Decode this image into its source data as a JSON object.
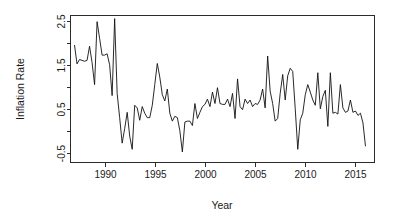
{
  "figure": {
    "background_color": "#ffffff",
    "line_color": "#111111",
    "axis_color": "#2b2b2b",
    "text_color": "#1a1a1a"
  },
  "chart_data": {
    "type": "line",
    "title": "",
    "subtitle": "",
    "xlabel": "Year",
    "ylabel": "Inflation Rate",
    "xlim": [
      1986.6,
      2016.9
    ],
    "ylim": [
      -0.72,
      2.62
    ],
    "grid": false,
    "legend": "none",
    "box": true,
    "x_ticks": [
      1990,
      1995,
      2000,
      2005,
      2010,
      2015
    ],
    "x_tick_labels": [
      "1990",
      "1995",
      "2000",
      "2005",
      "2010",
      "2015"
    ],
    "x_minor_ticks": [],
    "y_ticks": [
      -0.5,
      0.0,
      0.5,
      1.0,
      1.5,
      2.0,
      2.5
    ],
    "y_tick_labels": [
      "-0.5",
      "",
      "0.5",
      "",
      "1.5",
      "",
      "2.5"
    ],
    "series": [
      {
        "name": "Inflation Rate",
        "x": [
          1987.0,
          1987.25,
          1987.5,
          1987.75,
          1988.0,
          1988.25,
          1988.5,
          1988.75,
          1989.0,
          1989.25,
          1989.5,
          1989.75,
          1990.0,
          1990.25,
          1990.5,
          1990.75,
          1991.0,
          1991.25,
          1991.5,
          1991.75,
          1992.0,
          1992.25,
          1992.5,
          1992.75,
          1993.0,
          1993.25,
          1993.5,
          1993.75,
          1994.0,
          1994.25,
          1994.5,
          1994.75,
          1995.0,
          1995.25,
          1995.5,
          1995.75,
          1996.0,
          1996.25,
          1996.5,
          1996.75,
          1997.0,
          1997.25,
          1997.5,
          1997.75,
          1998.0,
          1998.25,
          1998.5,
          1998.75,
          1999.0,
          1999.25,
          1999.5,
          1999.75,
          2000.0,
          2000.25,
          2000.5,
          2000.75,
          2001.0,
          2001.25,
          2001.5,
          2001.75,
          2002.0,
          2002.25,
          2002.5,
          2002.75,
          2003.0,
          2003.25,
          2003.5,
          2003.75,
          2004.0,
          2004.25,
          2004.5,
          2004.75,
          2005.0,
          2005.25,
          2005.5,
          2005.75,
          2006.0,
          2006.25,
          2006.5,
          2006.75,
          2007.0,
          2007.25,
          2007.5,
          2007.75,
          2008.0,
          2008.25,
          2008.5,
          2008.75,
          2009.0,
          2009.25,
          2009.5,
          2009.75,
          2010.0,
          2010.25,
          2010.5,
          2010.75,
          2011.0,
          2011.25,
          2011.5,
          2011.75,
          2012.0,
          2012.25,
          2012.5,
          2012.75,
          2013.0,
          2013.25,
          2013.5,
          2013.75,
          2014.0,
          2014.25,
          2014.5,
          2014.75,
          2015.0,
          2015.25,
          2015.5,
          2015.75,
          2016.0
        ],
        "values": [
          1.95,
          1.52,
          1.62,
          1.6,
          1.58,
          1.6,
          1.92,
          1.55,
          1.05,
          2.48,
          2.1,
          1.72,
          1.72,
          1.75,
          1.5,
          0.8,
          2.55,
          0.85,
          0.3,
          -0.28,
          0.05,
          0.42,
          -0.12,
          -0.42,
          0.58,
          0.52,
          0.24,
          0.55,
          0.4,
          0.3,
          0.3,
          0.58,
          1.05,
          1.53,
          1.22,
          0.82,
          0.68,
          0.95,
          0.4,
          0.22,
          0.33,
          0.3,
          0.0,
          -0.48,
          0.2,
          0.22,
          0.22,
          0.12,
          0.62,
          0.28,
          0.42,
          0.55,
          0.6,
          0.72,
          0.55,
          0.88,
          0.62,
          0.98,
          0.62,
          0.6,
          0.6,
          0.72,
          0.55,
          0.85,
          0.28,
          1.18,
          0.55,
          0.48,
          0.72,
          0.62,
          0.7,
          0.55,
          0.62,
          0.6,
          0.7,
          0.95,
          0.52,
          1.7,
          0.9,
          0.62,
          0.22,
          0.28,
          0.85,
          1.28,
          0.7,
          1.25,
          1.42,
          1.35,
          0.5,
          -0.42,
          0.25,
          0.4,
          0.82,
          1.05,
          0.88,
          0.7,
          0.58,
          1.32,
          0.5,
          0.78,
          0.92,
          0.1,
          1.32,
          0.4,
          0.42,
          0.38,
          1.05,
          0.52,
          0.42,
          0.45,
          0.7,
          0.42,
          0.45,
          0.35,
          0.4,
          0.18,
          -0.35
        ]
      }
    ],
    "annotations": []
  }
}
